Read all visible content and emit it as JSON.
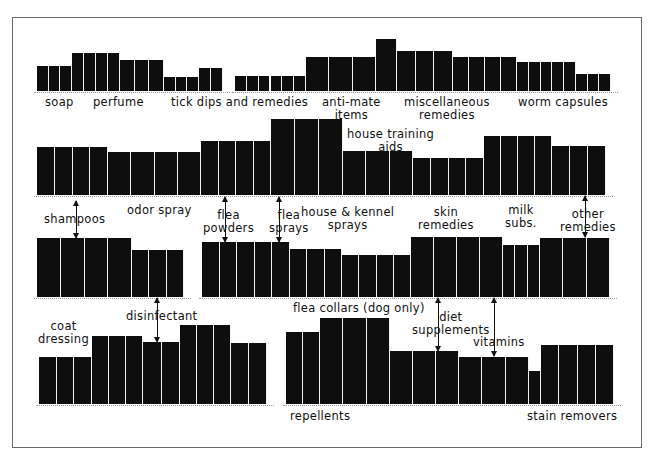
{
  "chart_data": {
    "type": "bar",
    "title": "",
    "xlabel": "",
    "ylabel": "",
    "grid": false,
    "legend": null,
    "rows": [
      {
        "row": 1,
        "baseline_y": 91,
        "groups": [
          {
            "x": 37,
            "segments": [
              {
                "n": 3,
                "w": 35,
                "h": 25
              },
              {
                "n": 4,
                "w": 48,
                "h": 38
              },
              {
                "n": 3,
                "w": 44,
                "h": 31
              },
              {
                "n": 3,
                "w": 35,
                "h": 14
              },
              {
                "n": 2,
                "w": 24,
                "h": 23
              }
            ]
          },
          {
            "x": 235,
            "segments": [
              {
                "n": 6,
                "w": 71,
                "h": 15
              },
              {
                "n": 3,
                "w": 70,
                "h": 34
              },
              {
                "n": 1,
                "w": 21,
                "h": 52
              },
              {
                "n": 3,
                "w": 56,
                "h": 40
              },
              {
                "n": 4,
                "w": 64,
                "h": 34
              },
              {
                "n": 5,
                "w": 59,
                "h": 29
              },
              {
                "n": 3,
                "w": 35,
                "h": 17
              }
            ]
          }
        ],
        "labels": [
          {
            "text": [
              "soap"
            ],
            "x": 45,
            "y": 96
          },
          {
            "text": [
              "perfume"
            ],
            "x": 93,
            "y": 96
          },
          {
            "text": [
              "tick dips and remedies"
            ],
            "x": 171,
            "y": 96
          },
          {
            "text": [
              "anti-mate",
              "items"
            ],
            "x": 322,
            "y": 96
          },
          {
            "text": [
              "miscellaneous",
              "remedies"
            ],
            "x": 404,
            "y": 96
          },
          {
            "text": [
              "worm capsules"
            ],
            "x": 518,
            "y": 96
          }
        ]
      },
      {
        "row": 2,
        "baseline_y": 195,
        "groups": [
          {
            "x": 37,
            "segments": [
              {
                "n": 4,
                "w": 71,
                "h": 48
              },
              {
                "n": 4,
                "w": 93,
                "h": 43
              },
              {
                "n": 4,
                "w": 70,
                "h": 54
              },
              {
                "n": 3,
                "w": 72,
                "h": 76
              },
              {
                "n": 3,
                "w": 70,
                "h": 44
              },
              {
                "n": 4,
                "w": 71,
                "h": 37
              },
              {
                "n": 4,
                "w": 68,
                "h": 59
              },
              {
                "n": 3,
                "w": 54,
                "h": 49
              }
            ]
          }
        ],
        "labels": [
          {
            "text": [
              "house training",
              "aids"
            ],
            "x": 347,
            "y": 128
          },
          {
            "text": [
              "shampoos"
            ],
            "x": 44,
            "y": 213
          },
          {
            "text": [
              "odor spray"
            ],
            "x": 127,
            "y": 204
          },
          {
            "text": [
              "flea",
              "powders"
            ],
            "x": 203,
            "y": 209
          },
          {
            "text": [
              "flea",
              "sprays"
            ],
            "x": 269,
            "y": 209
          },
          {
            "text": [
              "house & kennel",
              "sprays"
            ],
            "x": 301,
            "y": 206
          },
          {
            "text": [
              "skin",
              "remedies"
            ],
            "x": 418,
            "y": 206
          },
          {
            "text": [
              "milk",
              "subs."
            ],
            "x": 505,
            "y": 204
          },
          {
            "text": [
              "other",
              "remedies"
            ],
            "x": 560,
            "y": 208
          }
        ]
      },
      {
        "row": 3,
        "baseline_y": 297,
        "groups": [
          {
            "x": 37,
            "segments": [
              {
                "n": 4,
                "w": 95,
                "h": 59
              },
              {
                "n": 3,
                "w": 52,
                "h": 47
              }
            ]
          },
          {
            "x": 202,
            "segments": [
              {
                "n": 5,
                "w": 88,
                "h": 55
              },
              {
                "n": 3,
                "w": 52,
                "h": 48
              },
              {
                "n": 4,
                "w": 69,
                "h": 42
              },
              {
                "n": 4,
                "w": 92,
                "h": 60
              },
              {
                "n": 3,
                "w": 37,
                "h": 52
              },
              {
                "n": 3,
                "w": 70,
                "h": 59
              }
            ]
          }
        ],
        "labels": [
          {
            "text": [
              "disinfectant"
            ],
            "x": 126,
            "y": 310
          },
          {
            "text": [
              "flea collars (dog only)"
            ],
            "x": 293,
            "y": 302
          },
          {
            "text": [
              "diet",
              "supplements"
            ],
            "x": 412,
            "y": 311
          },
          {
            "text": [
              "vitamins"
            ],
            "x": 473,
            "y": 336
          }
        ]
      },
      {
        "row": 4,
        "baseline_y": 404,
        "groups": [
          {
            "x": 39,
            "segments": [
              {
                "n": 3,
                "w": 53,
                "h": 47
              },
              {
                "n": 3,
                "w": 51,
                "h": 68
              },
              {
                "n": 2,
                "w": 37,
                "h": 62
              },
              {
                "n": 3,
                "w": 51,
                "h": 79
              },
              {
                "n": 2,
                "w": 36,
                "h": 61
              }
            ]
          },
          {
            "x": 286,
            "segments": [
              {
                "n": 2,
                "w": 34,
                "h": 72
              },
              {
                "n": 3,
                "w": 70,
                "h": 86
              },
              {
                "n": 3,
                "w": 69,
                "h": 53
              },
              {
                "n": 3,
                "w": 70,
                "h": 47
              },
              {
                "n": 1,
                "w": 12,
                "h": 33
              },
              {
                "n": 4,
                "w": 73,
                "h": 59
              }
            ]
          }
        ],
        "labels": [
          {
            "text": [
              "coat",
              "dressing"
            ],
            "x": 38,
            "y": 320
          },
          {
            "text": [
              "repellents"
            ],
            "x": 290,
            "y": 410
          },
          {
            "text": [
              "stain removers"
            ],
            "x": 527,
            "y": 410
          }
        ]
      }
    ],
    "arrows": [
      {
        "x": 76,
        "y1": 201,
        "y2": 238,
        "dir": "both",
        "note": "shampoos to rows 2 and 3"
      },
      {
        "x": 225,
        "y1": 197,
        "y2": 242,
        "dir": "both",
        "note": "flea powders"
      },
      {
        "x": 279,
        "y1": 197,
        "y2": 242,
        "dir": "both",
        "note": "flea sprays"
      },
      {
        "x": 585,
        "y1": 196,
        "y2": 237,
        "dir": "both",
        "note": "other remedies"
      },
      {
        "x": 157,
        "y1": 298,
        "y2": 342,
        "dir": "both",
        "note": "disinfectant"
      },
      {
        "x": 438,
        "y1": 298,
        "y2": 351,
        "dir": "both",
        "note": "diet supplements"
      },
      {
        "x": 494,
        "y1": 298,
        "y2": 356,
        "dir": "both",
        "note": "vitamins"
      }
    ]
  }
}
